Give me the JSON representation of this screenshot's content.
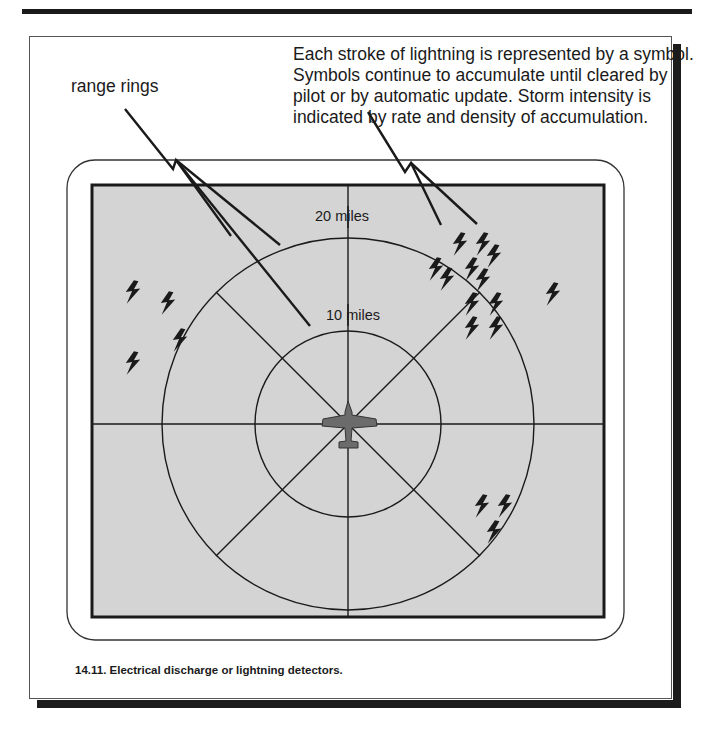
{
  "header": {
    "description_lines": [
      "Each stroke of lightning is represented by a symbol.",
      "Symbols continue to accumulate until cleared by",
      "pilot or by automatic update.  Storm intensity is",
      "indicated by rate and density of accumulation."
    ],
    "range_rings_label": "range rings"
  },
  "display": {
    "outer_ring_label": "20 miles",
    "inner_ring_label": "10 miles",
    "center_icon": "aircraft-icon",
    "strike_symbol": "lightning-bolt-icon",
    "colors": {
      "screen_background": "#d4d4d4",
      "lines": "#1a1a1a",
      "aircraft": "#6b6b6b",
      "shadow": "#1c1c1c"
    }
  },
  "caption": {
    "text": "14.11.  Electrical discharge or lightning detectors."
  }
}
